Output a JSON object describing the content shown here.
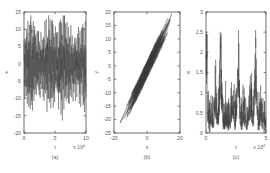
{
  "figure": {
    "background": "#ffffff",
    "line_color": "#3b3b3b",
    "axis_color": "#4a4a4a",
    "text_color": "#5a5a5a"
  },
  "chart_data": [
    {
      "type": "line",
      "panel": "a",
      "caption": "(a)",
      "title": "",
      "xlabel": "t",
      "ylabel": "x",
      "x_multiplier": "x 10",
      "x_multiplier_exp": "4",
      "xlim": [
        0,
        10
      ],
      "ylim": [
        -20,
        15
      ],
      "xticks": [
        0,
        5,
        10
      ],
      "xticklabels": [
        "0",
        "5",
        "10"
      ],
      "yticks": [
        -20,
        -15,
        -10,
        -5,
        0,
        5,
        10,
        15
      ],
      "yticklabels": [
        "-20",
        "-15",
        "-10",
        "-5",
        "0",
        "5",
        "10",
        "15"
      ],
      "grid": false,
      "legend": "none",
      "description": "dense noisy oscillating time series of x versus t spanning roughly -17 to +14",
      "n_points": 900,
      "seed": 17,
      "envelope_low": -17,
      "envelope_high": 14
    },
    {
      "type": "line",
      "panel": "b",
      "caption": "(b)",
      "title": "",
      "xlabel": "x",
      "ylabel": "y",
      "xlim": [
        -20,
        20
      ],
      "ylim": [
        -25,
        20
      ],
      "xticks": [
        -20,
        0,
        20
      ],
      "xticklabels": [
        "-20",
        "0",
        "20"
      ],
      "yticks": [
        -25,
        -20,
        -15,
        -10,
        -5,
        0,
        5,
        10,
        15,
        20
      ],
      "yticklabels": [
        "-25",
        "-20",
        "-15",
        "-10",
        "-5",
        "0",
        "5",
        "10",
        "15",
        "20"
      ],
      "grid": false,
      "legend": "none",
      "description": "phase portrait of y versus x forming a dense positively sloped diagonal band of overlapping trajectories",
      "n_points": 520,
      "seed": 29,
      "slope": 1.28,
      "band_width": 7.5
    },
    {
      "type": "line",
      "panel": "c",
      "caption": "(c)",
      "title": "",
      "xlabel": "t",
      "ylabel": "e",
      "x_multiplier": "x 10",
      "x_multiplier_exp": "4",
      "xlim": [
        0,
        5
      ],
      "ylim": [
        0,
        3
      ],
      "xticks": [
        0,
        5
      ],
      "xticklabels": [
        "0",
        "5"
      ],
      "yticks": [
        0,
        0.5,
        1,
        1.5,
        2,
        2.5,
        3
      ],
      "yticklabels": [
        "0",
        "0.5",
        "1",
        "1.5",
        "2",
        "2.5",
        "3"
      ],
      "grid": false,
      "legend": "none",
      "description": "spiky strictly positive error signal versus time with intermittent bursts reaching about 2.5",
      "n_points": 620,
      "seed": 43,
      "peak_max": 2.55,
      "baseline": 0.25
    }
  ]
}
